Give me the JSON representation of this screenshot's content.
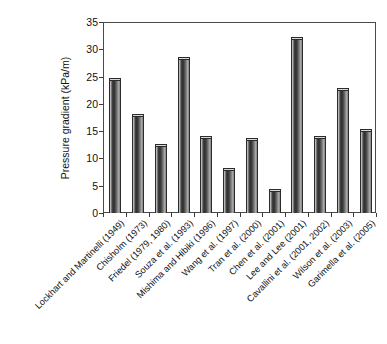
{
  "chart_data": {
    "type": "bar",
    "title": "",
    "subtitle": "",
    "xlabel": "",
    "ylabel": "Pressure gradient (kPa/m)",
    "categories": [
      "Lockhart and Martinelli (1949)",
      "Chisholm (1973)",
      "Friedel (1979, 1980)",
      "Souza et al. (1993)",
      "Mishima and Hibiki (1996)",
      "Wang et al. (1997)",
      "Tran et al. (2000)",
      "Chen et al. (2001)",
      "Lee and Lee (2001)",
      "Cavallini et al. (2001, 2002)",
      "Wilson et al. (2003)",
      "Garimella et al. (2005)"
    ],
    "values": [
      24.7,
      18.1,
      12.6,
      28.6,
      14.1,
      8.2,
      13.7,
      4.4,
      32.2,
      14.1,
      23.0,
      15.4
    ],
    "ylim": [
      0,
      35
    ],
    "yticks": [
      0,
      5,
      10,
      15,
      20,
      25,
      30,
      35
    ],
    "ytick_labels": [
      "0",
      "5",
      "10",
      "15",
      "20",
      "25",
      "30",
      "35"
    ],
    "grid": false,
    "legend": null,
    "legend_position": "none",
    "bar_color": "#3b3b3b",
    "frame_color": "#4a4a4a",
    "background_color": "#ffffff",
    "xtick_label_rotation": -45
  }
}
